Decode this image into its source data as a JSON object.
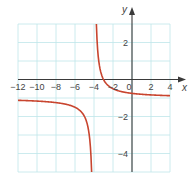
{
  "chart_data": {
    "type": "line",
    "title": "",
    "xlabel": "x",
    "ylabel": "y",
    "xlim": [
      -12,
      4
    ],
    "ylim": [
      -5,
      3
    ],
    "grid": true,
    "x_grid_step": 2,
    "y_grid_step": 1,
    "x_ticks": [
      -12,
      -10,
      -8,
      -6,
      -4,
      -2,
      0,
      2,
      4
    ],
    "x_tick_labels": [
      "−12",
      "−10",
      "−8",
      "−6",
      "−4",
      "−2",
      "0",
      "2",
      "4"
    ],
    "y_ticks": [
      2,
      -2,
      -4
    ],
    "y_tick_labels": [
      "2",
      "−2",
      "−4"
    ],
    "asymptotes": {
      "vertical_x": -4,
      "horizontal_y": -1
    },
    "function": "y = 1/(x+4) - 1",
    "series": [
      {
        "name": "left-branch",
        "x": [
          -12,
          -10,
          -8,
          -7,
          -6,
          -5,
          -4.6,
          -4.4,
          -4.3,
          -4.25
        ],
        "y": [
          -1.125,
          -1.167,
          -1.25,
          -1.333,
          -1.5,
          -2,
          -2.667,
          -3.5,
          -4.333,
          -5
        ]
      },
      {
        "name": "right-branch",
        "x": [
          -3.75,
          -3.7,
          -3.6,
          -3.5,
          -3.25,
          -3,
          -2.5,
          -2,
          -1,
          0,
          2,
          4
        ],
        "y": [
          3,
          2.333,
          1.5,
          1,
          0.333,
          0,
          -0.333,
          -0.5,
          -0.667,
          -0.75,
          -0.833,
          -0.875
        ]
      }
    ]
  },
  "colors": {
    "grid": "#bfe6ea",
    "axis": "#3a3a3a",
    "curve": "#c8452f",
    "text": "#444444"
  }
}
